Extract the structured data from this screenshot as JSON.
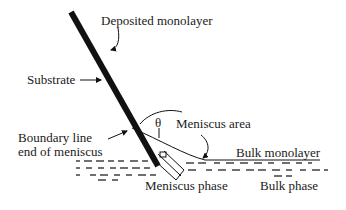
{
  "diagram": {
    "labels": {
      "deposited_monolayer": "Deposited monolayer",
      "substrate": "Substrate",
      "boundary_line_1": "Boundary line",
      "boundary_line_2": "end of meniscus",
      "theta": "θ",
      "meniscus_area": "Meniscus area",
      "bulk_monolayer": "Bulk monolayer",
      "meniscus_phase": "Meniscus phase",
      "bulk_phase": "Bulk phase"
    },
    "colors": {
      "ink": "#111111",
      "background": "#ffffff"
    }
  }
}
